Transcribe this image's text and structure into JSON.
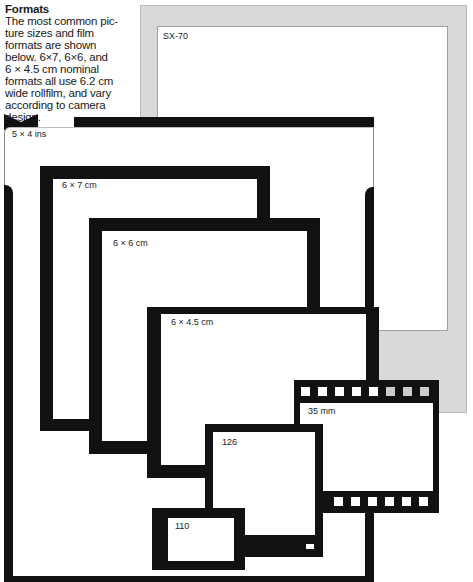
{
  "intro": {
    "heading": "Formats",
    "body_lines": [
      "The most common pic-",
      "ture sizes and film",
      "formats are shown",
      "below. 6×7, 6×6, and",
      "6 × 4.5 cm nominal",
      "formats all use 6.2 cm",
      "wide rollfilm, and vary",
      "according to camera",
      "design."
    ]
  },
  "formats": {
    "sx70": "SX-70",
    "five_by_four": "5 × 4 ins",
    "six_by_seven": "6 × 7 cm",
    "six_by_six": "6 × 6 cm",
    "six_by_four_five": "6 × 4.5 cm",
    "thirtyfive": "35 mm",
    "onetwentysix": "126",
    "onehundredten": "110"
  },
  "colors": {
    "frame_black": "#111111",
    "sx70_gray": "#d9d9d9",
    "background": "#ffffff"
  }
}
